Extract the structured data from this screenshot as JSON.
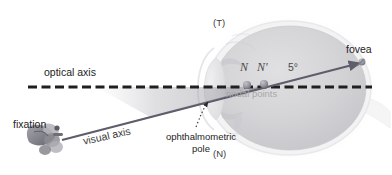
{
  "figure": {
    "width": 392,
    "height": 175,
    "background_color": "#ffffff"
  },
  "labels": {
    "optical_axis": "optical axis",
    "visual_axis": "visual axis",
    "fixation": "fixation",
    "ophthalmometric_pole": "ophthalmometric pole",
    "temporal_marker": "(T)",
    "nasal_marker": "(N)",
    "nodal_point_n": "N",
    "nodal_point_n_prime": "N'",
    "angle": "5°",
    "nodal_points": "nodal points",
    "fovea": "fovea"
  },
  "colors": {
    "optical_axis_dash": "#1f1f1f",
    "visual_axis_line": "#5a5a6a",
    "globe_fill": "#d2d2d4",
    "globe_edge": "#ececed",
    "wedge_shade": "#9a9aa2",
    "nodal_marker": "#8e8e96",
    "text_dark": "#232323",
    "text_mid": "#4a4a4a",
    "text_light": "#a8a8a8"
  },
  "geometry": {
    "optical_axis_y": 87,
    "optical_axis_x_start": 28,
    "optical_axis_x_end": 372,
    "visual_axis_start": [
      62,
      140
    ],
    "visual_axis_end": [
      363,
      62
    ],
    "nodal_point_n_position": [
      247,
      85
    ],
    "nodal_point_n_prime_position": [
      264,
      84
    ],
    "fovea_position": [
      363,
      62
    ],
    "ophthalmometric_pole_position": [
      207,
      100
    ],
    "globe_center": [
      290,
      88
    ],
    "globe_radius_x": 78,
    "globe_radius_y": 63
  }
}
